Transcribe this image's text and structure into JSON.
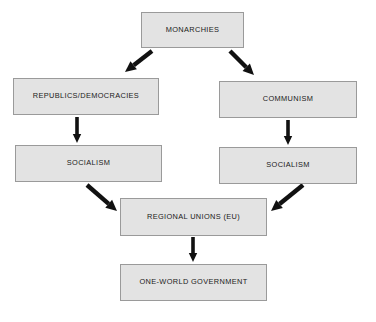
{
  "diagram": {
    "style": {
      "node_fill": "#e3e3e3",
      "node_border": "#9a9a9a",
      "arrow_color": "#111111",
      "background": "#ffffff",
      "text_color": "#1a1a1a"
    },
    "nodes": [
      {
        "id": "monarchies",
        "label": "MONARCHIES",
        "x": 141,
        "y": 12,
        "w": 103,
        "h": 36
      },
      {
        "id": "republics",
        "label": "REPUBLICS/DEMOCRACIES",
        "x": 13,
        "y": 78,
        "w": 146,
        "h": 37
      },
      {
        "id": "communism",
        "label": "COMMUNISM",
        "x": 219,
        "y": 81,
        "w": 138,
        "h": 37
      },
      {
        "id": "socialism-left",
        "label": "SOCIALISM",
        "x": 15,
        "y": 145,
        "w": 147,
        "h": 37
      },
      {
        "id": "socialism-right",
        "label": "SOCIALISM",
        "x": 219,
        "y": 147,
        "w": 138,
        "h": 37
      },
      {
        "id": "regional-unions",
        "label": "REGIONAL UNIONS (EU)",
        "x": 120,
        "y": 198,
        "w": 147,
        "h": 38
      },
      {
        "id": "one-world",
        "label": "ONE-WORLD GOVERNMENT",
        "x": 120,
        "y": 264,
        "w": 147,
        "h": 37
      }
    ],
    "edges": [
      {
        "id": "monarchies-to-republics",
        "from": "monarchies",
        "to": "republics",
        "kind": "diagonal-down-left",
        "x1": 152,
        "y1": 51,
        "x2": 125,
        "y2": 72
      },
      {
        "id": "monarchies-to-communism",
        "from": "monarchies",
        "to": "communism",
        "kind": "diagonal-down-right",
        "x1": 230,
        "y1": 51,
        "x2": 254,
        "y2": 75
      },
      {
        "id": "republics-to-socialism-left",
        "from": "republics",
        "to": "socialism-left",
        "kind": "vertical",
        "x1": 77,
        "y1": 117,
        "x2": 77,
        "y2": 143
      },
      {
        "id": "communism-to-socialism-right",
        "from": "communism",
        "to": "socialism-right",
        "kind": "vertical",
        "x1": 288,
        "y1": 120,
        "x2": 288,
        "y2": 145
      },
      {
        "id": "socialism-left-to-regional",
        "from": "socialism-left",
        "to": "regional-unions",
        "kind": "diagonal-down-right",
        "x1": 87,
        "y1": 185,
        "x2": 117,
        "y2": 211
      },
      {
        "id": "socialism-right-to-regional",
        "from": "socialism-right",
        "to": "regional-unions",
        "kind": "diagonal-down-left",
        "x1": 303,
        "y1": 185,
        "x2": 271,
        "y2": 211
      },
      {
        "id": "regional-to-one-world",
        "from": "regional-unions",
        "to": "one-world",
        "kind": "vertical",
        "x1": 193,
        "y1": 237,
        "x2": 193,
        "y2": 262
      }
    ]
  }
}
